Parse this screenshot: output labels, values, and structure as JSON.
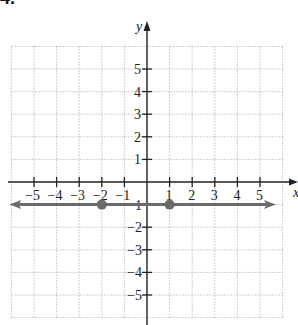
{
  "problem_number": "4.",
  "chart_data": {
    "type": "line",
    "title": "",
    "xlabel": "x",
    "ylabel": "y",
    "xlim": [
      -6,
      6
    ],
    "ylim": [
      -6,
      6
    ],
    "grid": true,
    "grid_style": "dotted",
    "x_ticks": [
      -5,
      -4,
      -3,
      -2,
      -1,
      1,
      2,
      3,
      4,
      5
    ],
    "y_ticks": [
      -5,
      -4,
      -3,
      -2,
      -1,
      1,
      2,
      3,
      4,
      5
    ],
    "x_tick_labels": [
      "−5",
      "−4",
      "−3",
      "−2",
      "−1",
      "1",
      "2",
      "3",
      "4",
      "5"
    ],
    "y_tick_labels": [
      "5",
      "4",
      "3",
      "2",
      "1",
      "−1",
      "−2",
      "−3",
      "−4",
      "−5"
    ],
    "series": [
      {
        "name": "y = -1",
        "kind": "horizontal line with arrows both ends",
        "equation": "y = -1",
        "color": "#6b6b6b",
        "x": [
          -6,
          5.7
        ],
        "y": [
          -1,
          -1
        ],
        "points": [
          {
            "x": -2,
            "y": -1
          },
          {
            "x": 1,
            "y": -1
          }
        ]
      }
    ],
    "colors": {
      "axis": "#222222",
      "grid": "#b0b0b0",
      "line": "#6b6b6b",
      "point": "#6b6b6b"
    }
  }
}
